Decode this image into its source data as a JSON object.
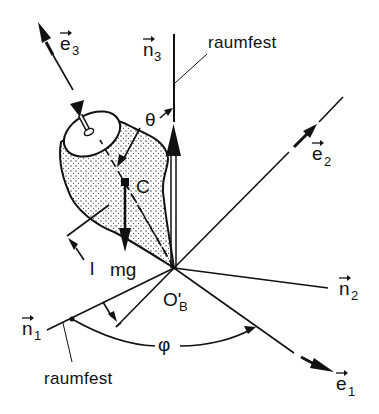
{
  "diagram": {
    "type": "spinning-top-kinematics",
    "colors": {
      "ink": "#111111",
      "background": "#ffffff",
      "stipple": "#333333"
    },
    "labels": {
      "e3": {
        "base": "e",
        "sub": "3",
        "arrow": "→"
      },
      "n3": {
        "base": "n",
        "sub": "3",
        "arrow": "→"
      },
      "e2": {
        "base": "e",
        "sub": "2",
        "arrow": "→"
      },
      "n2": {
        "base": "n",
        "sub": "2",
        "arrow": "→"
      },
      "n1": {
        "base": "n",
        "sub": "1",
        "arrow": "→"
      },
      "e1": {
        "base": "e",
        "sub": "1",
        "arrow": "→"
      },
      "raumfest_top": "raumfest",
      "raumfest_bottom": "raumfest",
      "theta": "θ",
      "phi": "φ",
      "center": "C",
      "weight": "mg",
      "length": "l",
      "origin": {
        "base": "O'",
        "sub": "B"
      }
    }
  }
}
